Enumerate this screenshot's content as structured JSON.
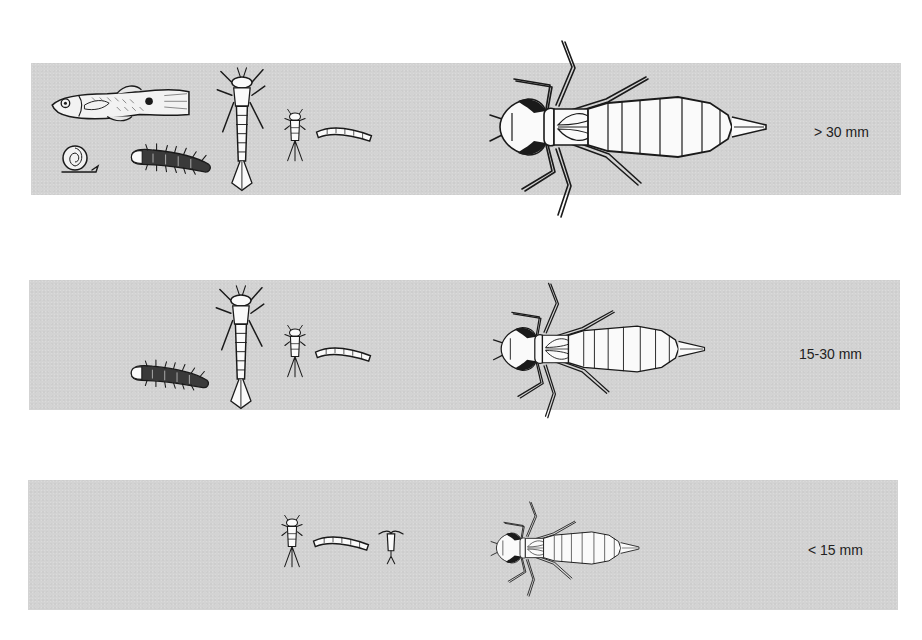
{
  "figure": {
    "band_color": "#d3d3d3",
    "ink_color": "#1a1a1a",
    "label_color": "#222222"
  },
  "rows": [
    {
      "size_label": "> 30 mm",
      "predator": "large dragonfly larva",
      "prey": [
        "fish",
        "snail",
        "beetle larva",
        "damselfly larva",
        "mayfly larva",
        "chironomid larva"
      ]
    },
    {
      "size_label": "15-30 mm",
      "predator": "medium dragonfly larva",
      "prey": [
        "beetle larva",
        "damselfly larva",
        "mayfly larva",
        "chironomid larva"
      ]
    },
    {
      "size_label": "< 15 mm",
      "predator": "small dragonfly larva",
      "prey": [
        "mayfly larva",
        "chironomid larva",
        "cladoceran"
      ]
    }
  ]
}
